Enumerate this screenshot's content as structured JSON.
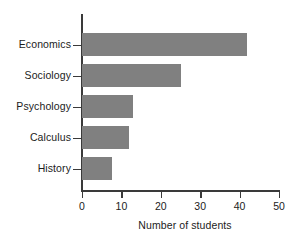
{
  "chart_data": {
    "type": "bar",
    "orientation": "horizontal",
    "title": "",
    "xlabel": "Number of students",
    "ylabel": "",
    "categories": [
      "Economics",
      "Sociology",
      "Psychology",
      "Calculus",
      "History"
    ],
    "values": [
      42,
      25,
      13,
      12,
      7.5
    ],
    "xlim": [
      0,
      50
    ],
    "xticks": [
      0,
      10,
      20,
      30,
      40,
      50
    ],
    "xtick_labels": [
      "0",
      "10",
      "20",
      "30",
      "40",
      "50"
    ],
    "grid": false,
    "legend": null,
    "bar_color": "#808080",
    "axis_color": "#3a3a3a",
    "text_color": "#1c1c1c",
    "background_color": "#ffffff"
  }
}
